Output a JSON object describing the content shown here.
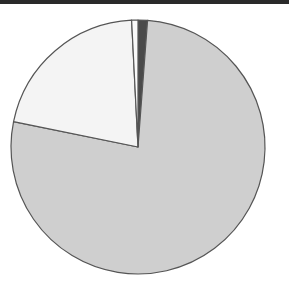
{
  "chart_data": {
    "type": "pie",
    "title": "",
    "categories": [
      "Slice A",
      "Slice B",
      "Slice C",
      "Slice D"
    ],
    "values": [
      77.0,
      21.0,
      0.8,
      1.2
    ],
    "colors": [
      "#cfcfcf",
      "#f4f4f4",
      "#fafafa",
      "#4a4a4a"
    ],
    "start_angle_deg": 90,
    "direction": "counterclockwise",
    "legend": null,
    "labels_visible": false
  },
  "layout": {
    "center": [
      138,
      147
    ],
    "radius": 127,
    "edge_color": "#555555",
    "top_bar_color": "#2a2a2a"
  }
}
